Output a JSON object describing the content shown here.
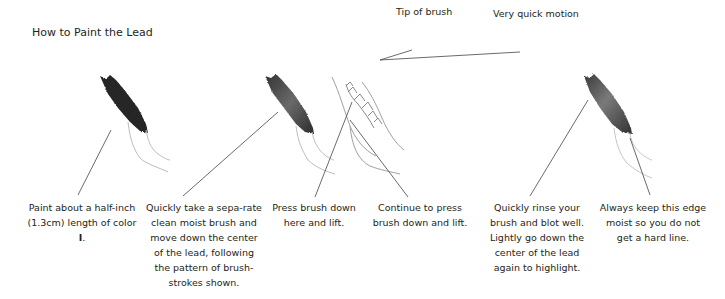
{
  "title": "How to Paint the Lead",
  "labels": {
    "tip_of_brush": "Tip of brush",
    "very_quick_motion": "Very quick motion"
  },
  "steps": [
    {
      "caption_pre": "Paint about a half-inch (1.3cm) length of color ",
      "caption_bold": "I",
      "caption_post": "."
    },
    {
      "caption": "Quickly take a sepa-rate clean moist brush and move down the center of the lead, following the pattern of brush-strokes shown."
    },
    {
      "caption": "Press brush down here and lift."
    },
    {
      "caption": "Continue to press brush down and lift."
    },
    {
      "caption": "Quickly rinse your brush and blot well. Lightly go down the center of the lead again to highlight."
    },
    {
      "caption": "Always keep this edge moist so you do not get a hard line."
    }
  ],
  "colors": {
    "text": "#231f20",
    "leader_line": "#444444",
    "stroke_dark": "#262626",
    "stroke_mid": "#5a5a5a",
    "stem": "#bdbdbd"
  }
}
